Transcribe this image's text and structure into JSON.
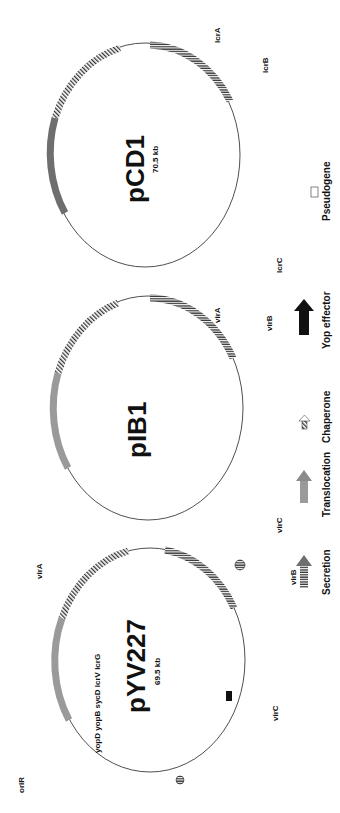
{
  "figure": {
    "orientation": "rotated 90 degrees counter-clockwise",
    "plasmids": [
      {
        "id": "pYV227",
        "name": "pYV227",
        "size": "69.5 kb",
        "labels_outer": [
          "oriR",
          "repBA",
          "arsH",
          "arsCBR",
          "tnpR",
          "tnpA",
          "yadA",
          "yscM2",
          "spyAB",
          "spyC",
          "yopE",
          "sycE",
          "sycH",
          "yopH",
          "yopO",
          "yopP",
          "ylpA",
          "yopQ",
          "yopT",
          "sycT",
          "yopM"
        ],
        "labels_inner": [
          "yopD",
          "yopB",
          "sycD",
          "lcrV",
          "lcrG",
          "lcrR",
          "yscV",
          "yscY",
          "yscX",
          "sycN",
          "tyeA",
          "yopN",
          "yscN-U",
          "yscW",
          "virF",
          "yscA-M"
        ],
        "region_labels": [
          "virA",
          "virB",
          "virC"
        ],
        "virB_letters": "N O P Q R S T U",
        "virC_letters": "A B C D E F G H I J K L M"
      },
      {
        "id": "pIB1",
        "name": "pIB1",
        "size": "",
        "labels_outer": [
          "yadA",
          "sycH",
          "sycE",
          "yopE",
          "partition genes",
          "ylpA",
          "yopK",
          "yopM",
          "repBA",
          "oriR",
          "ypkA",
          "yopJ",
          "yopH",
          "lcrQ"
        ],
        "labels_inner": [
          "yopD",
          "yopB",
          "lcrH",
          "lcrV",
          "lcrG",
          "lcrR",
          "yscV",
          "orf1,2",
          "yopN",
          "yscN-U",
          "lcrF",
          "yscA-L"
        ],
        "region_labels": [
          "virA",
          "virB",
          "virC"
        ],
        "virB_letters": "N O P Q R S T U",
        "virC_letters": "A B C D E F G H I J K L"
      },
      {
        "id": "pCD1",
        "name": "pCD1",
        "size": "70.5 kb",
        "labels_outer": [
          "sycH",
          "sycE",
          "yopE",
          "sopB",
          "sopA",
          "ylpA'",
          "yopK/yopQ",
          "yopT",
          "sycT",
          "yopM",
          "yadA'",
          "repBA",
          "ypkA",
          "yopJ/yopP",
          "yopH"
        ],
        "labels_inner": [
          "yopD",
          "yopB",
          "lcrH",
          "lcrV",
          "lcrG",
          "lcrR",
          "lcrD/yscV",
          "orf2,3,4",
          "tyeA",
          "lcrE/yopN",
          "yscN-U",
          "yscW",
          "lcrF/virF",
          "yscA-M"
        ],
        "region_labels": [
          "lcrA",
          "lcrB",
          "lcrC"
        ],
        "virB_letters": "N O P Q R S T U",
        "virC_letters": "A B C D E F G H I J K L M"
      }
    ],
    "legend": [
      {
        "key": "secretion",
        "label": "Secretion",
        "color": "#6e6e6e",
        "pattern": "vertical-stripes"
      },
      {
        "key": "translocation",
        "label": "Translocation",
        "color": "#9a9a9a",
        "pattern": "solid"
      },
      {
        "key": "chaperone",
        "label": "Chaperone",
        "color": "#ffffff",
        "pattern": "diagonal-hatch"
      },
      {
        "key": "yop-effector",
        "label": "Yop effector",
        "color": "#111111",
        "pattern": "solid"
      },
      {
        "key": "pseudogene",
        "label": "Pseudogene",
        "color": "#ffffff",
        "pattern": "outline"
      }
    ]
  }
}
